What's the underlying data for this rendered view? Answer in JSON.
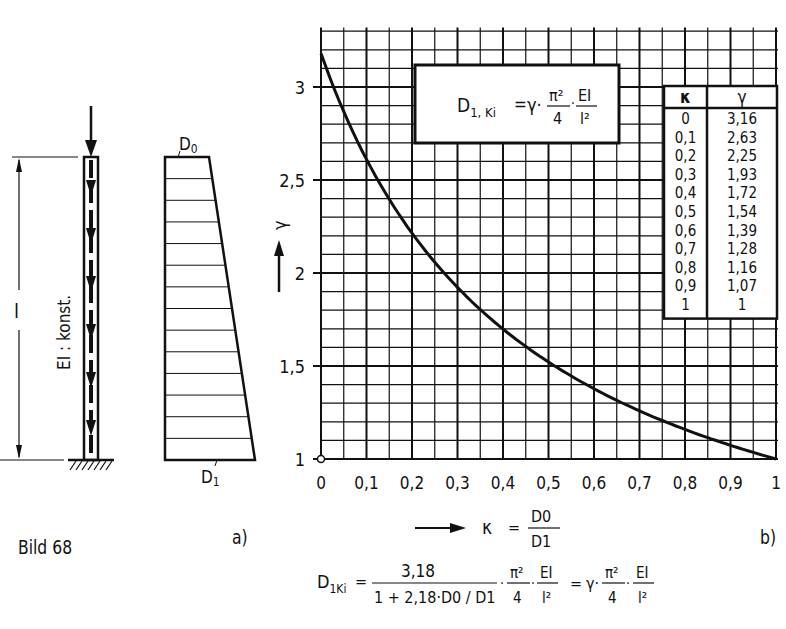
{
  "figure": {
    "caption": "Bild 68",
    "part_a_label": "a)",
    "part_b_label": "b)",
    "column": {
      "stiffness_label": "EI : konst.",
      "length_label": "l"
    },
    "depth_diagram": {
      "top_label": "D",
      "top_sub": "0",
      "bottom_label": "D",
      "bottom_sub": "1"
    },
    "boxed_formula": {
      "lhs": "D",
      "lhs_sub": "1, Ki",
      "rhs_gamma": "γ·",
      "pi_num": "π²",
      "pi_den": "4",
      "ei_num": "EI",
      "ei_den": "l²"
    },
    "x_definition": {
      "symbol": "κ",
      "eq": "=",
      "num": "D0",
      "den": "D1"
    },
    "bottom_formula": {
      "lhs": "D",
      "lhs_sub": "1Ki",
      "num": "3,18",
      "den": "1 + 2,18·D0 / D1",
      "tail": "· π²/4 · EI/l² = γ · π²/4 · EI/l²"
    }
  },
  "table": {
    "headers": [
      "κ",
      "γ"
    ],
    "rows": [
      [
        "0",
        "3,16"
      ],
      [
        "0,1",
        "2,63"
      ],
      [
        "0,2",
        "2,25"
      ],
      [
        "0,3",
        "1,93"
      ],
      [
        "0,4",
        "1,72"
      ],
      [
        "0,5",
        "1,54"
      ],
      [
        "0,6",
        "1,39"
      ],
      [
        "0,7",
        "1,28"
      ],
      [
        "0,8",
        "1,16"
      ],
      [
        "0,9",
        "1,07"
      ],
      [
        "1",
        "1"
      ]
    ]
  },
  "chart_data": {
    "type": "line",
    "title": "",
    "xlabel": "κ = D0 / D1",
    "ylabel": "γ",
    "x": [
      0,
      0.1,
      0.2,
      0.3,
      0.4,
      0.5,
      0.6,
      0.7,
      0.8,
      0.9,
      1.0
    ],
    "series": [
      {
        "name": "γ(κ) = 3,18 / (1 + 2,18·κ)",
        "values": [
          3.16,
          2.63,
          2.25,
          1.93,
          1.72,
          1.54,
          1.39,
          1.28,
          1.16,
          1.07,
          1.0
        ]
      }
    ],
    "x_ticks": [
      "0",
      "0,1",
      "0,2",
      "0,3",
      "0,4",
      "0,5",
      "0,6",
      "0,7",
      "0,8",
      "0,9",
      "1"
    ],
    "y_ticks": [
      "1",
      "1,5",
      "2",
      "2,5",
      "3"
    ],
    "xlim": [
      0,
      1
    ],
    "ylim": [
      1,
      3.32
    ],
    "grid": true,
    "grid_minor_x": 0.05,
    "grid_minor_y": 0.1,
    "legend": "none",
    "annotations": [
      "D1,Ki = γ·π²/4·EI/l²"
    ]
  }
}
